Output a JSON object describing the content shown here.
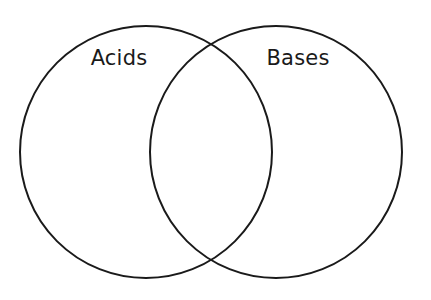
{
  "diagram": {
    "type": "venn",
    "title": "",
    "background_color": "#ffffff",
    "stroke_color": "#1a1a1a",
    "stroke_width": 2,
    "text_color": "#1a1a1a",
    "sets": [
      {
        "id": "left",
        "label": "Acids",
        "center_x": 146,
        "center_y": 152,
        "radius": 126,
        "label_x": 119,
        "label_y": 65
      },
      {
        "id": "right",
        "label": "Bases",
        "center_x": 276,
        "center_y": 152,
        "radius": 126,
        "label_x": 298,
        "label_y": 65
      }
    ],
    "intersection": {
      "label": "",
      "top_point_x": 211,
      "top_point_y": 34,
      "bottom_point_x": 211,
      "bottom_point_y": 270
    }
  }
}
